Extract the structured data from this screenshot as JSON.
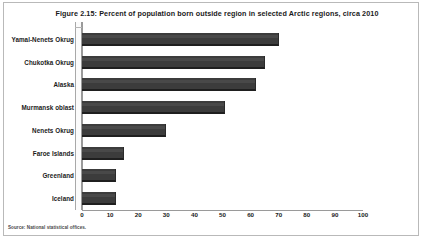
{
  "figure": {
    "title": "Figure 2.15: Percent of population born outside region in selected Arctic regions, circa 2010",
    "source_note": "Source: National statistical offices."
  },
  "chart_data": {
    "type": "bar",
    "orientation": "horizontal",
    "title": "Figure 2.15: Percent of population born outside region in selected Arctic regions, circa 2010",
    "xlabel": "",
    "ylabel": "",
    "xlim": [
      0,
      100
    ],
    "grid": false,
    "legend": null,
    "bar_color": "#3c3c3c",
    "xticks": [
      0,
      10,
      20,
      30,
      40,
      50,
      60,
      70,
      80,
      90,
      100
    ],
    "categories": [
      "Yamal-Nenets Okrug",
      "Chukotka Okrug",
      "Alaska",
      "Murmansk oblast",
      "Nenets Okrug",
      "Faroe Islands",
      "Greenland",
      "Iceland"
    ],
    "values": [
      70,
      65,
      62,
      51,
      30,
      15,
      12,
      12
    ]
  }
}
